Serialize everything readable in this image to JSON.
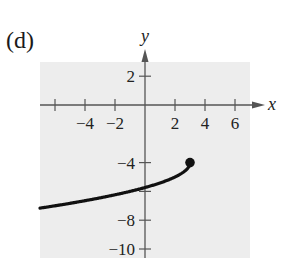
{
  "panel_label": "(d)",
  "chart_data": {
    "type": "line",
    "title": "",
    "xlabel": "x",
    "ylabel": "y",
    "xlim": [
      -7,
      7
    ],
    "ylim": [
      -11,
      3.5
    ],
    "grid": false,
    "background": "#ededed",
    "x_ticks": [
      -6,
      -4,
      -2,
      2,
      4,
      6
    ],
    "x_tick_labels": [
      "-4",
      "-2",
      "2",
      "4",
      "6"
    ],
    "x_tick_label_values": [
      -4,
      -2,
      2,
      4,
      6
    ],
    "y_ticks": [
      2,
      -4,
      -6,
      -8,
      -10
    ],
    "y_tick_labels": [
      "2",
      "-4",
      "-8",
      "-10"
    ],
    "y_tick_label_values": [
      2,
      -4,
      -8,
      -10
    ],
    "series": [
      {
        "name": "curve",
        "description": "y = -4 - sqrt(3 - x), closed endpoint at (3, -4)",
        "x": [
          -7,
          -6,
          -5,
          -4,
          -3,
          -2,
          -1,
          0,
          1,
          2,
          2.5,
          3
        ],
        "y": [
          -7.16,
          -7.0,
          -6.83,
          -6.65,
          -6.45,
          -6.24,
          -6.0,
          -5.73,
          -5.41,
          -5.0,
          -4.71,
          -4.0
        ],
        "color": "#111111",
        "endpoint": {
          "x": 3,
          "y": -4,
          "style": "closed"
        }
      }
    ]
  }
}
